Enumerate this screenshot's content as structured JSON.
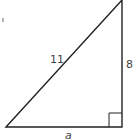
{
  "diagram": {
    "type": "right-triangle",
    "labels": {
      "hypotenuse": "11",
      "vertical_leg": "8",
      "horizontal_leg": "a"
    },
    "right_angle_marker": true,
    "colors": {
      "stroke": "#222222",
      "label": "#444444",
      "background": "#ffffff"
    }
  }
}
